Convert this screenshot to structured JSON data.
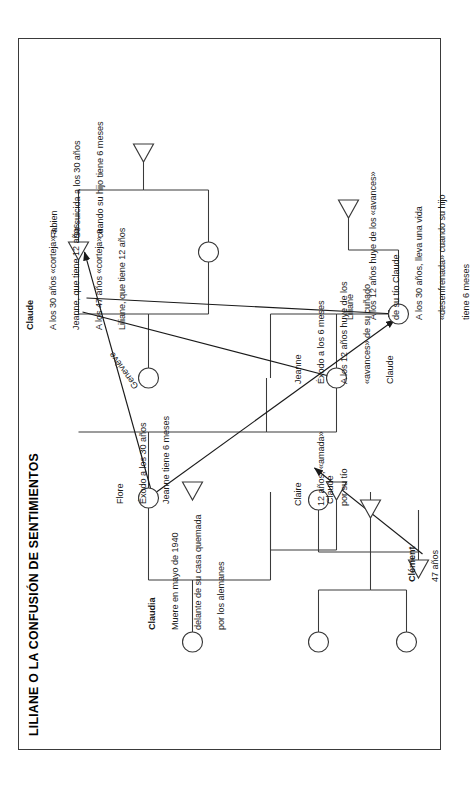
{
  "document": {
    "title": "LILIANE O LA CONFUSIÓN DE SENTIMIENTOS",
    "type": "genogram",
    "language": "es",
    "orientation": "rotated-90-ccw",
    "page_border_color": "#3a3a3a",
    "ink_color": "#1a1a1a"
  },
  "legend": {
    "female_symbol": "circle",
    "male_symbol": "triangle"
  },
  "persons": [
    {
      "id": "claudia",
      "name": "Claudia",
      "symbol": "circle",
      "notes": [
        "Muere en mayo de 1940",
        "delante de su casa quemada",
        "por los alemanes"
      ]
    },
    {
      "id": "flore",
      "name": "Flore",
      "symbol": "circle",
      "notes": [
        "Éxodo a los 30 años",
        "Jeanne tiene 6 meses"
      ]
    },
    {
      "id": "genevieve",
      "name": "Geneviève",
      "symbol": "circle",
      "notes": []
    },
    {
      "id": "claude",
      "name": "Claude",
      "symbol": "triangle",
      "notes": [
        "A los 30 años «corteja» a",
        "Jeanne, que tiene 12 años",
        "A los 47 años «corteja» a",
        "Liliane, que tiene 12 años"
      ]
    },
    {
      "id": "fabien",
      "name": "Fabien",
      "symbol": "triangle",
      "notes": [
        "Se suicida a los 30 años",
        "cuando su hijo tiene 6 meses"
      ]
    },
    {
      "id": "jeanne",
      "name": "Jeanne",
      "symbol": "circle",
      "notes": [
        "Éxodo a los 6 meses",
        "A los 12 años huye de los",
        "«avances» de su cuñado",
        "Claude"
      ]
    },
    {
      "id": "liliane",
      "name": "Liliane",
      "symbol": "circle",
      "notes": [
        "A los 12 años huye de los «avances»",
        "de su tío Claude",
        "A los 30 años, lleva una vida",
        "«desenfrenada» cuando su hijo",
        "tiene 6 meses"
      ]
    },
    {
      "id": "clement",
      "name": "Clément",
      "symbol": "triangle",
      "notes": [
        "47 años"
      ]
    },
    {
      "id": "claude2",
      "name": "Claude",
      "symbol": "triangle",
      "notes": []
    },
    {
      "id": "claire",
      "name": "Claire",
      "symbol": "circle",
      "notes": [
        "12 años, «amada»",
        "por su tío"
      ]
    }
  ]
}
